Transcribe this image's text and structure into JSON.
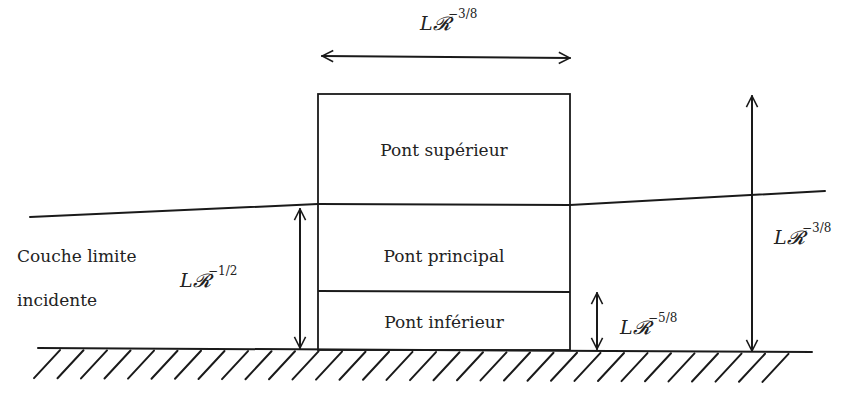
{
  "diagram": {
    "type": "boundary-layer triple-deck schematic",
    "regions": {
      "upper_deck": "Pont supérieur",
      "main_deck": "Pont principal",
      "lower_deck": "Pont inférieur"
    },
    "incident_layer": {
      "line1": "Couche limite",
      "line2": "incidente"
    },
    "dimensions": {
      "width_top": {
        "base": "L𝓡",
        "exp": "−3/8"
      },
      "incident_thickness": {
        "base": "L𝓡",
        "exp": "−1/2"
      },
      "lower_deck_height": {
        "base": "L𝓡",
        "exp": "−5/8"
      },
      "upper_deck_height": {
        "base": "L𝓡",
        "exp": "−3/8"
      }
    },
    "colors": {
      "stroke": "#1a1a1a",
      "text": "#222222",
      "background": "#ffffff"
    }
  }
}
